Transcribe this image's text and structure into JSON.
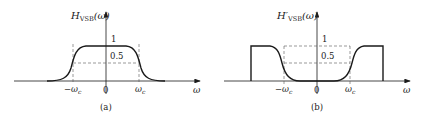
{
  "figure_a": {
    "y_label_main": "H",
    "y_label_sub": "VSB",
    "y_label_arg": "(ω)",
    "x_label": "ω",
    "tick_neg": "−ω",
    "tick_pos": "ω",
    "tick_sub": "c",
    "origin": "0",
    "level_1": "1",
    "level_half": "0.5",
    "caption": "(a)"
  },
  "figure_b": {
    "y_label_main": "H′",
    "y_label_sub": "VSB",
    "y_label_arg": "(ω)",
    "x_label": "ω",
    "tick_neg": "−ω",
    "tick_pos": "ω",
    "tick_sub": "c",
    "origin": "0",
    "level_1": "1",
    "level_half": "0.5",
    "caption": "(b)"
  },
  "colors": {
    "line": "#1a1a1a",
    "dash": "#555555"
  }
}
